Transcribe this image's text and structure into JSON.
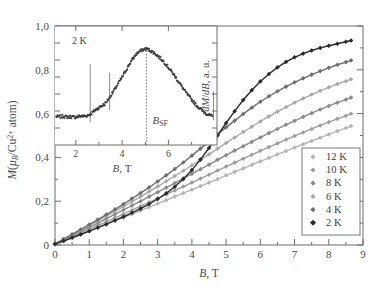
{
  "figure": {
    "background": "#ffffff",
    "frame_color": "#6d6d6d"
  },
  "main_axes": {
    "xlabel_italic": "B",
    "xlabel_rest": ", T",
    "ylabel_parts": {
      "m": "M",
      "open": "(",
      "mu": "μ",
      "sub_b": "B",
      "slash": "/Cu",
      "sup": "2+",
      "atom": " atom",
      "close": ")"
    },
    "xticks": [
      "0",
      "1",
      "2",
      "3",
      "4",
      "5",
      "6",
      "7",
      "8",
      "9"
    ],
    "yticks": [
      "0",
      "0,2",
      "0,4",
      "0,6",
      "0,8",
      "1,0"
    ],
    "xlim": [
      0,
      9
    ],
    "ylim": [
      0,
      1.0
    ]
  },
  "inset_axes": {
    "temperature_label": "2 K",
    "xlabel_italic": "B",
    "xlabel_rest": ", T",
    "ylabel_italic_1": "dM",
    "ylabel_slash": "/",
    "ylabel_italic_2": "dB",
    "ylabel_rest": ", a. u.",
    "xticks": [
      "2",
      "4",
      "6"
    ],
    "annotation": {
      "text_main": "B",
      "text_sub": "SF",
      "field_value": 5.05
    },
    "xlim": [
      1.1,
      8.1
    ],
    "ylim": [
      0,
      1.15
    ]
  },
  "legend": {
    "items": [
      {
        "label": "12 K",
        "color": "#b5b5b5"
      },
      {
        "label": "10 K",
        "color": "#9e9e9e"
      },
      {
        "label": "8 K",
        "color": "#8a8a8a"
      },
      {
        "label": "6 K",
        "color": "#a8a8a8"
      },
      {
        "label": "4 K",
        "color": "#6f6f6f"
      },
      {
        "label": "2 K",
        "color": "#2b2b2b"
      }
    ],
    "border_color": "#7a7a7a"
  },
  "chart_data": {
    "type": "line",
    "title": "",
    "xlabel": "B, T",
    "ylabel": "M(μB/Cu2+ atom)",
    "xlim": [
      0,
      9
    ],
    "ylim": [
      0,
      1.0
    ],
    "grid": false,
    "legend_position": "lower-right",
    "x": [
      0,
      0.25,
      0.5,
      0.75,
      1.0,
      1.25,
      1.5,
      1.75,
      2.0,
      2.25,
      2.5,
      2.75,
      3.0,
      3.25,
      3.5,
      3.75,
      4.0,
      4.25,
      4.5,
      4.75,
      5.0,
      5.25,
      5.5,
      5.75,
      6.0,
      6.25,
      6.5,
      6.75,
      7.0,
      7.25,
      7.5,
      7.75,
      8.0,
      8.25,
      8.5,
      8.65
    ],
    "series": [
      {
        "name": "12 K",
        "color": "#b5b5b5",
        "values": [
          0.005,
          0.019,
          0.034,
          0.049,
          0.064,
          0.079,
          0.094,
          0.11,
          0.125,
          0.141,
          0.157,
          0.173,
          0.189,
          0.205,
          0.221,
          0.237,
          0.253,
          0.269,
          0.285,
          0.301,
          0.318,
          0.334,
          0.35,
          0.366,
          0.382,
          0.398,
          0.414,
          0.429,
          0.445,
          0.46,
          0.475,
          0.49,
          0.505,
          0.52,
          0.534,
          0.543
        ]
      },
      {
        "name": "10 K",
        "color": "#9e9e9e",
        "values": [
          0.005,
          0.021,
          0.038,
          0.055,
          0.072,
          0.089,
          0.106,
          0.124,
          0.141,
          0.159,
          0.177,
          0.195,
          0.213,
          0.231,
          0.249,
          0.267,
          0.285,
          0.303,
          0.321,
          0.34,
          0.358,
          0.376,
          0.394,
          0.412,
          0.43,
          0.447,
          0.464,
          0.481,
          0.498,
          0.514,
          0.53,
          0.546,
          0.561,
          0.576,
          0.59,
          0.599
        ]
      },
      {
        "name": "8 K",
        "color": "#8a8a8a",
        "values": [
          0.005,
          0.024,
          0.043,
          0.062,
          0.081,
          0.1,
          0.12,
          0.14,
          0.16,
          0.18,
          0.2,
          0.221,
          0.241,
          0.262,
          0.283,
          0.304,
          0.325,
          0.346,
          0.367,
          0.389,
          0.41,
          0.431,
          0.451,
          0.471,
          0.491,
          0.511,
          0.53,
          0.549,
          0.567,
          0.585,
          0.602,
          0.619,
          0.635,
          0.65,
          0.664,
          0.673
        ]
      },
      {
        "name": "6 K",
        "color": "#a8a8a8",
        "values": [
          0.005,
          0.026,
          0.047,
          0.068,
          0.089,
          0.11,
          0.132,
          0.154,
          0.176,
          0.198,
          0.221,
          0.244,
          0.267,
          0.291,
          0.315,
          0.339,
          0.364,
          0.389,
          0.414,
          0.44,
          0.466,
          0.491,
          0.516,
          0.54,
          0.564,
          0.587,
          0.609,
          0.63,
          0.65,
          0.669,
          0.687,
          0.704,
          0.72,
          0.735,
          0.748,
          0.757
        ]
      },
      {
        "name": "4 K",
        "color": "#6f6f6f",
        "values": [
          0.005,
          0.027,
          0.049,
          0.071,
          0.093,
          0.116,
          0.139,
          0.163,
          0.187,
          0.212,
          0.237,
          0.263,
          0.29,
          0.318,
          0.347,
          0.377,
          0.408,
          0.44,
          0.472,
          0.505,
          0.537,
          0.568,
          0.598,
          0.627,
          0.654,
          0.679,
          0.702,
          0.723,
          0.743,
          0.761,
          0.778,
          0.794,
          0.809,
          0.823,
          0.835,
          0.843
        ]
      },
      {
        "name": "2 K",
        "color": "#2b2b2b",
        "values": [
          0.004,
          0.018,
          0.033,
          0.048,
          0.063,
          0.079,
          0.095,
          0.112,
          0.129,
          0.147,
          0.166,
          0.187,
          0.21,
          0.236,
          0.266,
          0.301,
          0.342,
          0.39,
          0.443,
          0.5,
          0.557,
          0.611,
          0.662,
          0.707,
          0.747,
          0.781,
          0.811,
          0.836,
          0.857,
          0.874,
          0.888,
          0.9,
          0.91,
          0.919,
          0.928,
          0.934
        ]
      }
    ],
    "inset": {
      "type": "line",
      "xlabel": "B, T",
      "ylabel": "dM/dB, a. u.",
      "series_name": "2 K",
      "color": "#3a3a3a",
      "xlim": [
        1.1,
        8.1
      ],
      "ylim": [
        0,
        1.15
      ],
      "peak_field": 5.05,
      "peak_label": "B_SF",
      "x": [
        1.15,
        1.3,
        1.45,
        1.6,
        1.75,
        1.9,
        2.05,
        2.2,
        2.35,
        2.5,
        2.65,
        2.8,
        2.95,
        3.1,
        3.25,
        3.4,
        3.55,
        3.7,
        3.85,
        4.0,
        4.15,
        4.3,
        4.45,
        4.6,
        4.75,
        4.9,
        5.05,
        5.2,
        5.35,
        5.5,
        5.65,
        5.8,
        5.95,
        6.1,
        6.25,
        6.4,
        6.55,
        6.7,
        6.85,
        7.0,
        7.15,
        7.3,
        7.45,
        7.6,
        7.75,
        7.9
      ],
      "y": [
        0.275,
        0.272,
        0.278,
        0.27,
        0.274,
        0.268,
        0.272,
        0.28,
        0.278,
        0.285,
        0.3,
        0.33,
        0.355,
        0.375,
        0.395,
        0.44,
        0.49,
        0.545,
        0.6,
        0.655,
        0.715,
        0.775,
        0.83,
        0.875,
        0.905,
        0.92,
        0.93,
        0.915,
        0.895,
        0.87,
        0.84,
        0.805,
        0.765,
        0.72,
        0.675,
        0.625,
        0.575,
        0.525,
        0.48,
        0.44,
        0.4,
        0.365,
        0.335,
        0.31,
        0.29,
        0.275
      ]
    }
  }
}
